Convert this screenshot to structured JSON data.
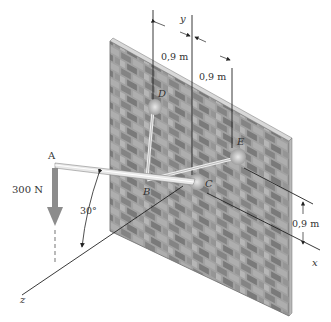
{
  "figure": {
    "type": "3D statics diagram"
  },
  "axes": {
    "x_label": "x",
    "y_label": "y",
    "z_label": "z"
  },
  "points": {
    "A": "A",
    "B": "B",
    "C": "C",
    "D": "D",
    "E": "E"
  },
  "dimensions": {
    "d_left_top": "0,9 m",
    "d_right_top": "0,9 m",
    "d_vertical_right": "0,9 m"
  },
  "load": {
    "value": "300 N",
    "direction": "down"
  },
  "angle": {
    "value": "30°"
  },
  "colors": {
    "wall_base": "#8a8a8a",
    "brick_dark": "#6e6e6e",
    "brick_light": "#b4b4b4",
    "mortar": "#cfcfcf",
    "boom": "#e6e6e6",
    "force_arrow": "#8c8c8c",
    "line": "#222222"
  }
}
